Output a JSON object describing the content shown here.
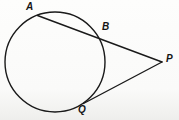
{
  "figure": {
    "name": "circle-secant-tangent-figure",
    "width": 179,
    "height": 120,
    "background_color": "#fbfbfa",
    "stroke_color": "#1a1a1a",
    "stroke_width": 1.4
  },
  "circle": {
    "name": "main-circle",
    "center_x": 55,
    "center_y": 62,
    "radius": 50
  },
  "points": {
    "A": {
      "label": "A",
      "x": 37.5,
      "y": 15.5,
      "label_x": 26,
      "label_y": 2
    },
    "B": {
      "label": "B",
      "x": 99.5,
      "y": 38.0,
      "label_x": 102,
      "label_y": 22
    },
    "P": {
      "label": "P",
      "x": 162.0,
      "y": 62.0,
      "label_x": 166,
      "label_y": 54
    },
    "Q": {
      "label": "Q",
      "x": 83.5,
      "y": 103.5,
      "label_x": 78,
      "label_y": 105
    }
  },
  "segments": [
    {
      "name": "secant-line-APB",
      "from": "A",
      "to": "P",
      "kind": "secant"
    },
    {
      "name": "tangent-line-QP",
      "from": "Q",
      "to": "P",
      "kind": "tangent"
    }
  ],
  "labels": {
    "a": "A",
    "b": "B",
    "p": "P",
    "q": "Q"
  }
}
